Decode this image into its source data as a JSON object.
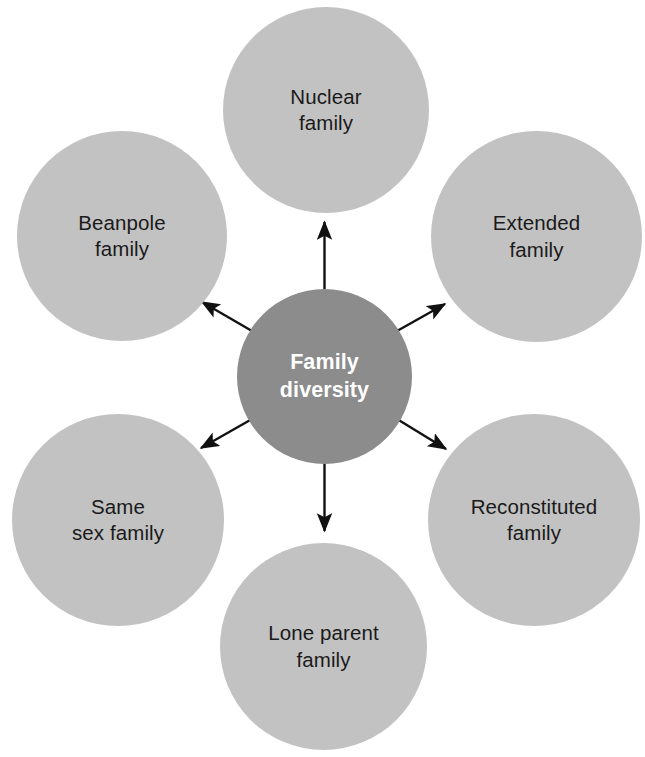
{
  "diagram": {
    "title": "Family diversity",
    "type": "hub-and-spoke",
    "colors": {
      "outer_node_fill": "#c2c2c2",
      "center_node_fill": "#8c8c8c",
      "center_node_text": "#ffffff",
      "outer_node_text": "#1a1a1a",
      "arrow": "#111111",
      "background": "#ffffff"
    },
    "center": {
      "label": "Family\ndiversity"
    },
    "nodes": [
      {
        "id": "nuclear",
        "label": "Nuclear\nfamily",
        "position": "top"
      },
      {
        "id": "extended",
        "label": "Extended\nfamily",
        "position": "top-right"
      },
      {
        "id": "reconstituted",
        "label": "Reconstituted\nfamily",
        "position": "bottom-right"
      },
      {
        "id": "lone-parent",
        "label": "Lone parent\nfamily",
        "position": "bottom"
      },
      {
        "id": "same-sex",
        "label": "Same\nsex family",
        "position": "bottom-left"
      },
      {
        "id": "beanpole",
        "label": "Beanpole\nfamily",
        "position": "top-left"
      }
    ],
    "arrows": [
      {
        "id": "arrow-to-nuclear",
        "from": "center",
        "to": "nuclear",
        "direction": "up"
      },
      {
        "id": "arrow-to-extended",
        "from": "center",
        "to": "extended",
        "direction": "up-right"
      },
      {
        "id": "arrow-to-reconstituted",
        "from": "center",
        "to": "reconstituted",
        "direction": "down-right"
      },
      {
        "id": "arrow-to-lone-parent",
        "from": "center",
        "to": "lone-parent",
        "direction": "down"
      },
      {
        "id": "arrow-to-same-sex",
        "from": "center",
        "to": "same-sex",
        "direction": "down-left"
      },
      {
        "id": "arrow-to-beanpole",
        "from": "center",
        "to": "beanpole",
        "direction": "up-left"
      }
    ]
  }
}
